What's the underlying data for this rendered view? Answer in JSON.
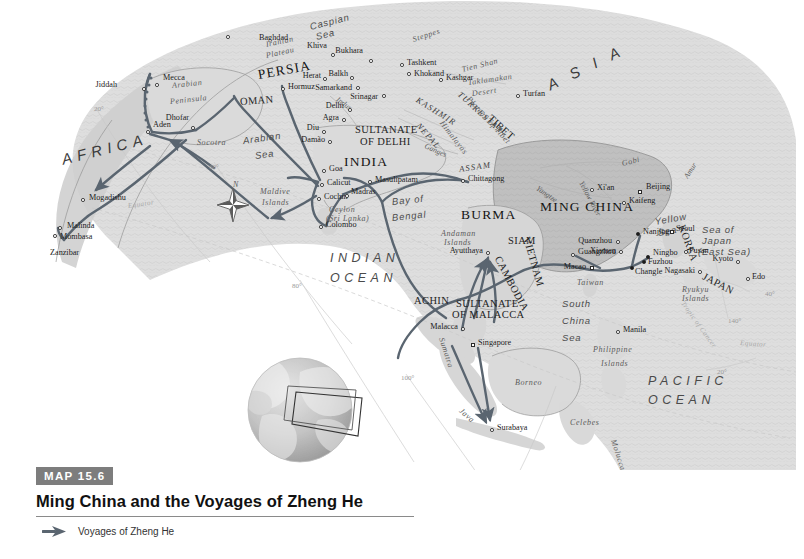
{
  "caption": {
    "badge_word": "MAP",
    "badge_number": "15.6",
    "title": "Ming China and the Voyages of Zheng He",
    "badge_color": "#7d7d7d"
  },
  "legend": {
    "items": [
      {
        "label": "Voyages of Zheng He",
        "symbol": "arrow",
        "color": "#5a6570"
      }
    ]
  },
  "map": {
    "route_color": "#5a6570",
    "land_color": "#d9d9d9",
    "ming_china_color": "#b9b9b9",
    "ocean_color": "#ffffff",
    "graticule_color": "#c8c8c8",
    "continents": [
      {
        "name": "AFRICA",
        "x": 62,
        "y": 158,
        "rot": -14
      },
      {
        "name": "A S I A",
        "x": 548,
        "y": 84,
        "rot": -26
      }
    ],
    "oceans": [
      {
        "name": "INDIAN",
        "x": 330,
        "y": 258,
        "rot": 0
      },
      {
        "name": "OCEAN",
        "x": 330,
        "y": 278,
        "rot": 0
      },
      {
        "name": "PACIFIC",
        "x": 648,
        "y": 381,
        "rot": 0
      },
      {
        "name": "OCEAN",
        "x": 648,
        "y": 400,
        "rot": 0
      }
    ],
    "seas": [
      {
        "name": "Arabian",
        "x": 243,
        "y": 142,
        "rot": -8
      },
      {
        "name": "Sea",
        "x": 255,
        "y": 157,
        "rot": -8
      },
      {
        "name": "Bay of",
        "x": 392,
        "y": 203,
        "rot": -6
      },
      {
        "name": "Bengal",
        "x": 392,
        "y": 219,
        "rot": -6
      },
      {
        "name": "South",
        "x": 562,
        "y": 305,
        "rot": 0
      },
      {
        "name": "China",
        "x": 562,
        "y": 322,
        "rot": 0
      },
      {
        "name": "Sea",
        "x": 562,
        "y": 339,
        "rot": 0
      },
      {
        "name": "Caspian",
        "x": 310,
        "y": 28,
        "rot": -14
      },
      {
        "name": "Sea",
        "x": 316,
        "y": 38,
        "rot": -14
      },
      {
        "name": "Yellow",
        "x": 655,
        "y": 223,
        "rot": -10
      },
      {
        "name": "Sea",
        "x": 658,
        "y": 234,
        "rot": -10
      },
      {
        "name": "Sea of",
        "x": 702,
        "y": 231,
        "rot": 0
      },
      {
        "name": "Japan",
        "x": 702,
        "y": 242,
        "rot": 0
      },
      {
        "name": "(East Sea)",
        "x": 698,
        "y": 253,
        "rot": 0
      }
    ],
    "countries": [
      {
        "name": "PERSIA",
        "x": 258,
        "y": 74,
        "cls": "country-lg",
        "rot": -10
      },
      {
        "name": "OMAN",
        "x": 240,
        "y": 103,
        "cls": "country",
        "rot": -4
      },
      {
        "name": "INDIA",
        "x": 344,
        "y": 161,
        "cls": "country-lg",
        "rot": 0
      },
      {
        "name": "SULTANATE",
        "x": 355,
        "y": 131,
        "cls": "country",
        "rot": 0
      },
      {
        "name": "OF DELHI",
        "x": 360,
        "y": 143,
        "cls": "country",
        "rot": 0
      },
      {
        "name": "BURMA",
        "x": 461,
        "y": 214,
        "cls": "country-lg",
        "rot": 0
      },
      {
        "name": "SIAM",
        "x": 508,
        "y": 242,
        "cls": "country",
        "rot": 0
      },
      {
        "name": "CAMBODIA",
        "x": 497,
        "y": 258,
        "cls": "country",
        "rot": 62
      },
      {
        "name": "VIETNAM",
        "x": 526,
        "y": 238,
        "cls": "country",
        "rot": 74
      },
      {
        "name": "ACHIN",
        "x": 414,
        "y": 302,
        "cls": "country",
        "rot": 0
      },
      {
        "name": "SULTANATE",
        "x": 456,
        "y": 305,
        "cls": "country",
        "rot": 0
      },
      {
        "name": "OF MALACCA",
        "x": 452,
        "y": 316,
        "cls": "country",
        "rot": 0
      },
      {
        "name": "MING CHINA",
        "x": 540,
        "y": 206,
        "cls": "country-lg",
        "rot": 0
      },
      {
        "name": "KOREA",
        "x": 681,
        "y": 226,
        "cls": "country",
        "rot": 70
      },
      {
        "name": "JAPAN",
        "x": 703,
        "y": 277,
        "cls": "country",
        "rot": 28
      },
      {
        "name": "TIBET",
        "x": 489,
        "y": 118,
        "cls": "country",
        "rot": 42
      },
      {
        "name": "ASSAM",
        "x": 459,
        "y": 171,
        "cls": "region",
        "rot": -8
      },
      {
        "name": "KASHMIR",
        "x": 417,
        "y": 101,
        "cls": "region",
        "rot": 32
      },
      {
        "name": "NEPAL",
        "x": 418,
        "y": 126,
        "cls": "region",
        "rot": 48
      },
      {
        "name": "TURKESTAN",
        "x": 459,
        "y": 95,
        "cls": "region",
        "rot": 42
      }
    ],
    "regions": [
      {
        "name": "Arabian",
        "x": 172,
        "y": 88,
        "rot": -6
      },
      {
        "name": "Peninsula",
        "x": 170,
        "y": 104,
        "rot": -6
      },
      {
        "name": "Iranian",
        "x": 266,
        "y": 47,
        "rot": -12
      },
      {
        "name": "Plateau",
        "x": 266,
        "y": 58,
        "rot": -12
      },
      {
        "name": "Steppes",
        "x": 413,
        "y": 42,
        "rot": -18
      },
      {
        "name": "Gobi",
        "x": 622,
        "y": 166,
        "rot": -14
      },
      {
        "name": "Taklamakan",
        "x": 468,
        "y": 85,
        "rot": -8
      },
      {
        "name": "Desert",
        "x": 472,
        "y": 96,
        "rot": -8
      },
      {
        "name": "Tien Shan",
        "x": 462,
        "y": 72,
        "rot": -14
      },
      {
        "name": "Plateau of Tibet",
        "x": 468,
        "y": 100,
        "rot": 48
      },
      {
        "name": "Himalayas",
        "x": 441,
        "y": 124,
        "rot": 52
      },
      {
        "name": "Sumatra",
        "x": 441,
        "y": 340,
        "rot": 72
      },
      {
        "name": "Java",
        "x": 460,
        "y": 412,
        "rot": 42
      },
      {
        "name": "Borneo",
        "x": 515,
        "y": 385,
        "rot": 0
      },
      {
        "name": "Celebes",
        "x": 570,
        "y": 425,
        "rot": 0
      },
      {
        "name": "Moluccas",
        "x": 613,
        "y": 442,
        "rot": 72
      },
      {
        "name": "Taiwan",
        "x": 577,
        "y": 285,
        "rot": 0
      },
      {
        "name": "Philippine",
        "x": 593,
        "y": 352,
        "rot": 0
      },
      {
        "name": "Islands",
        "x": 601,
        "y": 366,
        "rot": 0
      },
      {
        "name": "Maldive",
        "x": 260,
        "y": 194,
        "rot": 0
      },
      {
        "name": "Islands",
        "x": 262,
        "y": 205,
        "rot": 0
      },
      {
        "name": "Andaman",
        "x": 441,
        "y": 236,
        "rot": 0
      },
      {
        "name": "Islands",
        "x": 444,
        "y": 245,
        "rot": 0
      },
      {
        "name": "Ryukyu",
        "x": 682,
        "y": 292,
        "rot": 0
      },
      {
        "name": "Islands",
        "x": 682,
        "y": 301,
        "rot": 0
      },
      {
        "name": "Ceylon",
        "x": 329,
        "y": 212,
        "rot": 0
      },
      {
        "name": "(Sri Lanka)",
        "x": 326,
        "y": 221,
        "rot": 0
      },
      {
        "name": "Socotra",
        "x": 197,
        "y": 145,
        "rot": 0
      },
      {
        "name": "Timor",
        "x": 569,
        "y": 494,
        "rot": 0
      },
      {
        "name": "Timor",
        "x": 563,
        "y": 504,
        "rot": 0
      }
    ],
    "rivers": [
      {
        "name": "Yangtze",
        "x": 537,
        "y": 190,
        "rot": 34
      },
      {
        "name": "Yellow River",
        "x": 581,
        "y": 184,
        "rot": 62
      },
      {
        "name": "Ganges",
        "x": 425,
        "y": 148,
        "rot": 24
      },
      {
        "name": "Indus",
        "x": 337,
        "y": 101,
        "rot": 36
      },
      {
        "name": "Amur",
        "x": 686,
        "y": 180,
        "rot": -58
      }
    ],
    "cities": [
      {
        "name": "Baghdad",
        "x": 228,
        "y": 37,
        "dx": 31,
        "dy": 3,
        "dot": "open",
        "anchor": "left"
      },
      {
        "name": "Hormuz",
        "x": 283,
        "y": 89,
        "dx": 5,
        "dy": 0,
        "dot": "open",
        "anchor": "left"
      },
      {
        "name": "Jiddah",
        "x": 144,
        "y": 89,
        "dx": -27,
        "dy": -2,
        "dot": "open",
        "anchor": "right"
      },
      {
        "name": "Mecca",
        "x": 157,
        "y": 85,
        "dx": 6,
        "dy": -5,
        "dot": "open",
        "anchor": "left"
      },
      {
        "name": "Aden",
        "x": 148,
        "y": 132,
        "dx": 5,
        "dy": -5,
        "dot": "open",
        "anchor": "left"
      },
      {
        "name": "Dhofar",
        "x": 193,
        "y": 128,
        "dx": -4,
        "dy": -8,
        "dot": "open",
        "anchor": "right"
      },
      {
        "name": "Mogadishu",
        "x": 83,
        "y": 200,
        "dx": 6,
        "dy": 0,
        "dot": "open",
        "anchor": "left"
      },
      {
        "name": "Malinda",
        "x": 60,
        "y": 228,
        "dx": 7,
        "dy": 0,
        "dot": "open",
        "anchor": "left"
      },
      {
        "name": "Mombasa",
        "x": 55,
        "y": 236,
        "dx": 5,
        "dy": 3,
        "dot": "open",
        "anchor": "left"
      },
      {
        "name": "Zanzibar",
        "x": 48,
        "y": 253,
        "dx": 2,
        "dy": 2,
        "dot": "none",
        "anchor": "left"
      },
      {
        "name": "Khiva",
        "x": 333,
        "y": 55,
        "dx": -6,
        "dy": -7,
        "dot": "open",
        "anchor": "right"
      },
      {
        "name": "Bukhara",
        "x": 371,
        "y": 61,
        "dx": -8,
        "dy": -8,
        "dot": "open",
        "anchor": "right"
      },
      {
        "name": "Tashkent",
        "x": 402,
        "y": 65,
        "dx": 5,
        "dy": 0,
        "dot": "open",
        "anchor": "left"
      },
      {
        "name": "Khokand",
        "x": 409,
        "y": 74,
        "dx": 5,
        "dy": 2,
        "dot": "open",
        "anchor": "left"
      },
      {
        "name": "Kashgar",
        "x": 441,
        "y": 80,
        "dx": 5,
        "dy": 0,
        "dot": "open",
        "anchor": "left"
      },
      {
        "name": "Herat",
        "x": 325,
        "y": 79,
        "dx": -4,
        "dy": -1,
        "dot": "open",
        "anchor": "right"
      },
      {
        "name": "Balkh",
        "x": 352,
        "y": 78,
        "dx": -4,
        "dy": -2,
        "dot": "open",
        "anchor": "right"
      },
      {
        "name": "Samarkand",
        "x": 358,
        "y": 88,
        "dx": -6,
        "dy": 2,
        "dot": "open",
        "anchor": "right"
      },
      {
        "name": "Srinagar",
        "x": 384,
        "y": 96,
        "dx": -6,
        "dy": 3,
        "dot": "open",
        "anchor": "right"
      },
      {
        "name": "Turfan",
        "x": 518,
        "y": 96,
        "dx": 5,
        "dy": 0,
        "dot": "open",
        "anchor": "left"
      },
      {
        "name": "Delhi",
        "x": 350,
        "y": 110,
        "dx": -6,
        "dy": -2,
        "dot": "open",
        "anchor": "right"
      },
      {
        "name": "Agra",
        "x": 344,
        "y": 120,
        "dx": -5,
        "dy": 0,
        "dot": "open",
        "anchor": "right"
      },
      {
        "name": "Diu",
        "x": 324,
        "y": 132,
        "dx": -5,
        "dy": -2,
        "dot": "open",
        "anchor": "right"
      },
      {
        "name": "Damão",
        "x": 330,
        "y": 142,
        "dx": -5,
        "dy": 0,
        "dot": "open",
        "anchor": "right"
      },
      {
        "name": "Goa",
        "x": 324,
        "y": 171,
        "dx": 5,
        "dy": 0,
        "dot": "open",
        "anchor": "left"
      },
      {
        "name": "Calicut",
        "x": 322,
        "y": 185,
        "dx": 5,
        "dy": 0,
        "dot": "open",
        "anchor": "left"
      },
      {
        "name": "Cochin",
        "x": 319,
        "y": 199,
        "dx": 5,
        "dy": 0,
        "dot": "open",
        "anchor": "left"
      },
      {
        "name": "Madras",
        "x": 347,
        "y": 196,
        "dx": 4,
        "dy": -2,
        "dot": "open",
        "anchor": "left"
      },
      {
        "name": "Masulipatam",
        "x": 370,
        "y": 182,
        "dx": 5,
        "dy": 0,
        "dot": "open",
        "anchor": "left"
      },
      {
        "name": "Colombo",
        "x": 321,
        "y": 227,
        "dx": 5,
        "dy": 0,
        "dot": "open",
        "anchor": "left"
      },
      {
        "name": "Chittagong",
        "x": 463,
        "y": 181,
        "dx": 5,
        "dy": 0,
        "dot": "open",
        "anchor": "left"
      },
      {
        "name": "Ayutthaya",
        "x": 488,
        "y": 253,
        "dx": -5,
        "dy": 0,
        "dot": "open",
        "anchor": "right"
      },
      {
        "name": "Malacca",
        "x": 463,
        "y": 329,
        "dx": -5,
        "dy": 0,
        "dot": "open",
        "anchor": "right"
      },
      {
        "name": "Singapore",
        "x": 473,
        "y": 345,
        "dx": 5,
        "dy": 0,
        "dot": "sq",
        "anchor": "left"
      },
      {
        "name": "Surabaya",
        "x": 492,
        "y": 430,
        "dx": 5,
        "dy": 0,
        "dot": "open",
        "anchor": "left"
      },
      {
        "name": "Manila",
        "x": 618,
        "y": 332,
        "dx": 5,
        "dy": 0,
        "dot": "open",
        "anchor": "left"
      },
      {
        "name": "Xi'an",
        "x": 592,
        "y": 190,
        "dx": 5,
        "dy": 0,
        "dot": "open",
        "anchor": "left"
      },
      {
        "name": "Beijing",
        "x": 640,
        "y": 192,
        "dx": 6,
        "dy": -3,
        "dot": "sq",
        "anchor": "left"
      },
      {
        "name": "Kaifeng",
        "x": 624,
        "y": 203,
        "dx": 5,
        "dy": 0,
        "dot": "open",
        "anchor": "left"
      },
      {
        "name": "Nanjing",
        "x": 638,
        "y": 234,
        "dx": 5,
        "dy": 0,
        "dot": "filled",
        "anchor": "left"
      },
      {
        "name": "Quanzhou",
        "x": 618,
        "y": 242,
        "dx": -6,
        "dy": 1,
        "dot": "open",
        "anchor": "right"
      },
      {
        "name": "Xiamen",
        "x": 621,
        "y": 252,
        "dx": -5,
        "dy": 1,
        "dot": "open",
        "anchor": "right"
      },
      {
        "name": "Guangzhou",
        "x": 573,
        "y": 255,
        "dx": 5,
        "dy": -1,
        "dot": "open",
        "anchor": "left"
      },
      {
        "name": "Macao",
        "x": 592,
        "y": 268,
        "dx": -6,
        "dy": 1,
        "dot": "sq",
        "anchor": "right"
      },
      {
        "name": "Fuzhou",
        "x": 644,
        "y": 262,
        "dx": 4,
        "dy": 2,
        "dot": "filled",
        "anchor": "left"
      },
      {
        "name": "Changle",
        "x": 632,
        "y": 268,
        "dx": 3,
        "dy": 6,
        "dot": "filled",
        "anchor": "left"
      },
      {
        "name": "Ningbo",
        "x": 648,
        "y": 257,
        "dx": 5,
        "dy": -2,
        "dot": "filled",
        "anchor": "left"
      },
      {
        "name": "Seoul",
        "x": 672,
        "y": 232,
        "dx": 4,
        "dy": -1,
        "dot": "sq",
        "anchor": "left"
      },
      {
        "name": "Pusan",
        "x": 686,
        "y": 252,
        "dx": 3,
        "dy": 1,
        "dot": "open",
        "anchor": "left"
      },
      {
        "name": "Nagasaki",
        "x": 700,
        "y": 272,
        "dx": -5,
        "dy": 1,
        "dot": "open",
        "anchor": "right"
      },
      {
        "name": "Kyoto",
        "x": 738,
        "y": 262,
        "dx": -5,
        "dy": -1,
        "dot": "open",
        "anchor": "right"
      },
      {
        "name": "Edo",
        "x": 748,
        "y": 279,
        "dx": 4,
        "dy": 0,
        "dot": "open",
        "anchor": "left"
      }
    ],
    "graticule_labels": [
      {
        "text": "20°",
        "x": 94,
        "y": 112
      },
      {
        "text": "60°",
        "x": 209,
        "y": 170
      },
      {
        "text": "80°",
        "x": 292,
        "y": 289
      },
      {
        "text": "100°",
        "x": 401,
        "y": 381
      },
      {
        "text": "120°",
        "x": 505,
        "y": 495
      },
      {
        "text": "140°",
        "x": 728,
        "y": 324
      },
      {
        "text": "40°",
        "x": 765,
        "y": 297
      },
      {
        "text": "20°",
        "x": 717,
        "y": 375
      }
    ],
    "graticule_lines": [
      {
        "text": "Equator",
        "x": 128,
        "y": 209,
        "rot": -8
      },
      {
        "text": "Equator",
        "x": 740,
        "y": 346,
        "rot": 4
      },
      {
        "text": "Tropic of Cancer",
        "x": 682,
        "y": 305,
        "rot": 54
      }
    ],
    "compass": {
      "label": "N",
      "x": 233,
      "y": 187
    }
  }
}
